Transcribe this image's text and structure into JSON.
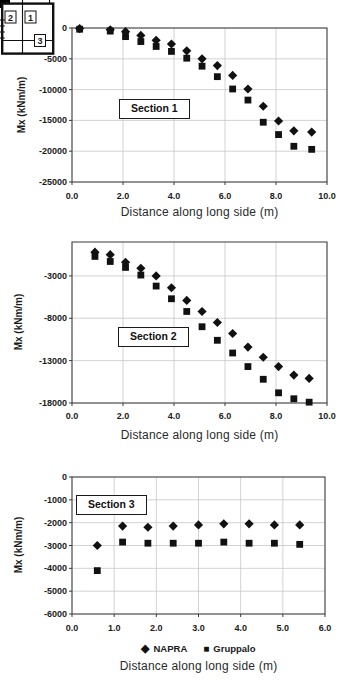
{
  "colors": {
    "marker": "#111111",
    "grid": "#c6c6c6",
    "axis_border": "#3a3a3a",
    "text": "#1b1b1b",
    "background": "#ffffff"
  },
  "legend": {
    "items": [
      {
        "label": "NAPRA",
        "marker": "diamond"
      },
      {
        "label": "Gruppalo",
        "marker": "square"
      }
    ]
  },
  "chart_data": [
    {
      "type": "scatter",
      "section_label": "Section 1",
      "ylabel": "Mx (kNm/m)",
      "xlabel": "Distance along long side (m)",
      "xlim": [
        0,
        10
      ],
      "ylim": [
        -25000,
        0
      ],
      "grid": true,
      "xtick_values": [
        0,
        2,
        4,
        6,
        8,
        10
      ],
      "xtick_labels": [
        "0.0",
        "2.0",
        "4.0",
        "6.0",
        "8.0",
        "10.0"
      ],
      "ytick_values": [
        0,
        -5000,
        -10000,
        -15000,
        -20000,
        -25000
      ],
      "ytick_labels": [
        "0",
        "-5000",
        "-10000",
        "-15000",
        "-20000",
        "-25000"
      ],
      "x": [
        0.3,
        1.5,
        2.1,
        2.7,
        3.3,
        3.9,
        4.5,
        5.1,
        5.7,
        6.3,
        6.9,
        7.5,
        8.1,
        8.7,
        9.4
      ],
      "series": [
        {
          "name": "NAPRA",
          "marker": "diamond",
          "values": [
            -100,
            -300,
            -600,
            -1200,
            -2000,
            -2600,
            -3700,
            -5000,
            -6100,
            -7700,
            -9900,
            -12700,
            -15100,
            -16700,
            -16900
          ]
        },
        {
          "name": "Gruppalo",
          "marker": "square",
          "values": [
            -200,
            -500,
            -1400,
            -2200,
            -3000,
            -3800,
            -4900,
            -6200,
            -7900,
            -9900,
            -11700,
            -15300,
            -17300,
            -19200,
            -19700
          ]
        }
      ],
      "inset_diagram": {
        "region_labels": [
          "2",
          "1",
          "3"
        ]
      }
    },
    {
      "type": "scatter",
      "section_label": "Section 2",
      "ylabel": "Mx (kNm/m)",
      "xlabel": "Distance along long side (m)",
      "xlim": [
        0,
        10
      ],
      "ylim": [
        -18000,
        1000
      ],
      "grid": true,
      "xtick_values": [
        0,
        2,
        4,
        6,
        8,
        10
      ],
      "xtick_labels": [
        "0.0",
        "2.0",
        "4.0",
        "6.0",
        "8.0",
        "10.0"
      ],
      "ytick_values": [
        -3000,
        -8000,
        -13000,
        -18000
      ],
      "ytick_labels": [
        "-3000",
        "-8000",
        "-13000",
        "-18000"
      ],
      "x": [
        0.9,
        1.5,
        2.1,
        2.7,
        3.3,
        3.9,
        4.5,
        5.1,
        5.7,
        6.3,
        6.9,
        7.5,
        8.1,
        8.7,
        9.3
      ],
      "series": [
        {
          "name": "NAPRA",
          "marker": "diamond",
          "values": [
            -200,
            -500,
            -1400,
            -2100,
            -3000,
            -4400,
            -5900,
            -7200,
            -8500,
            -9800,
            -11400,
            -12600,
            -13700,
            -14700,
            -15100
          ]
        },
        {
          "name": "Gruppalo",
          "marker": "square",
          "values": [
            -700,
            -1300,
            -2000,
            -2900,
            -4200,
            -5700,
            -7200,
            -9000,
            -10600,
            -12100,
            -13700,
            -15200,
            -16800,
            -17500,
            -17900
          ]
        }
      ]
    },
    {
      "type": "scatter",
      "section_label": "Section 3",
      "ylabel": "Mx (kNm/m)",
      "xlabel": "Distance along long side (m)",
      "xlim": [
        0,
        6
      ],
      "ylim": [
        -6000,
        0
      ],
      "grid": true,
      "xtick_values": [
        0,
        1,
        2,
        3,
        4,
        5,
        6
      ],
      "xtick_labels": [
        "0.0",
        "1.0",
        "2.0",
        "3.0",
        "4.0",
        "5.0",
        "6.0"
      ],
      "ytick_values": [
        0,
        -1000,
        -2000,
        -3000,
        -4000,
        -5000,
        -6000
      ],
      "ytick_labels": [
        "0",
        "-1000",
        "-2000",
        "-3000",
        "-4000",
        "-5000",
        "-6000"
      ],
      "x": [
        0.6,
        1.2,
        1.8,
        2.4,
        3.0,
        3.6,
        4.2,
        4.8,
        5.4
      ],
      "series": [
        {
          "name": "NAPRA",
          "marker": "diamond",
          "values": [
            -3000,
            -2150,
            -2200,
            -2150,
            -2100,
            -2050,
            -2050,
            -2100,
            -2100
          ]
        },
        {
          "name": "Gruppalo",
          "marker": "square",
          "values": [
            -4100,
            -2850,
            -2900,
            -2900,
            -2900,
            -2850,
            -2900,
            -2900,
            -2950
          ]
        }
      ]
    }
  ]
}
